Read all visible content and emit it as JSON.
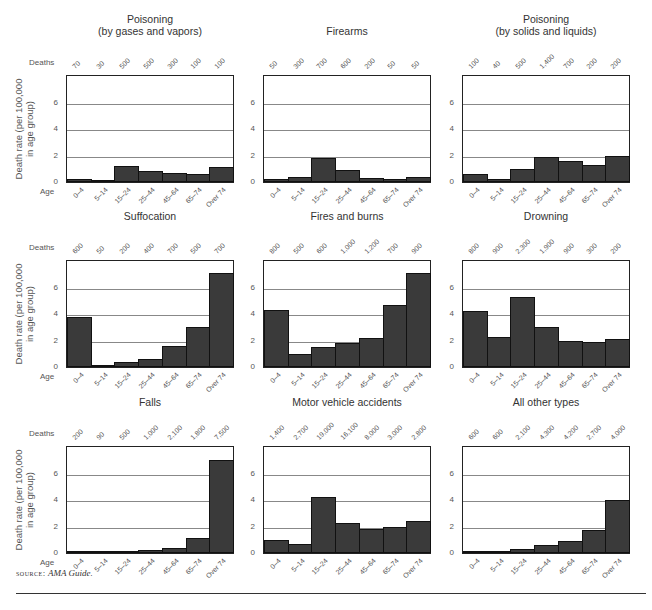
{
  "labels": {
    "deaths": "Deaths",
    "age": "Age",
    "ylabel": "Death rate (per 100,000\nin age group)",
    "source_prefix": "source:",
    "source_text": "AMA Guide."
  },
  "chart_data": [
    {
      "type": "bar",
      "title": "Poisoning\n(by gases and vapors)",
      "categories": [
        "0–4",
        "5–14",
        "15–24",
        "25–44",
        "45–64",
        "65–74",
        "Over 74"
      ],
      "deaths": [
        "70",
        "30",
        "500",
        "500",
        "300",
        "100",
        "100"
      ],
      "values": [
        0.2,
        0.1,
        1.2,
        0.8,
        0.7,
        0.6,
        1.1
      ],
      "ylabel": "Death rate (per 100,000 in age group)",
      "xlabel": "Age",
      "ylim": [
        0,
        8
      ],
      "yticks": [
        0,
        2,
        4,
        6
      ],
      "grid": true
    },
    {
      "type": "bar",
      "title": "Firearms",
      "categories": [
        "0–4",
        "5–14",
        "15–24",
        "25–44",
        "45–64",
        "65–74",
        "Over 74"
      ],
      "deaths": [
        "50",
        "300",
        "700",
        "600",
        "200",
        "50",
        "50"
      ],
      "values": [
        0.2,
        0.4,
        1.8,
        0.9,
        0.3,
        0.2,
        0.4
      ],
      "ylim": [
        0,
        8
      ],
      "yticks": [
        0,
        2,
        4,
        6
      ],
      "grid": true
    },
    {
      "type": "bar",
      "title": "Poisoning\n(by solids and liquids)",
      "categories": [
        "0–4",
        "5–14",
        "15–24",
        "25–44",
        "45–64",
        "65–74",
        "Over 74"
      ],
      "deaths": [
        "100",
        "40",
        "500",
        "1,400",
        "700",
        "200",
        "200"
      ],
      "values": [
        0.6,
        0.2,
        1.0,
        1.9,
        1.6,
        1.3,
        2.0
      ],
      "ylim": [
        0,
        8
      ],
      "yticks": [
        0,
        2,
        4,
        6
      ],
      "grid": true
    },
    {
      "type": "bar",
      "title": "Suffocation",
      "categories": [
        "0–4",
        "5–14",
        "15–24",
        "25–44",
        "45–64",
        "65–74",
        "Over 74"
      ],
      "deaths": [
        "600",
        "50",
        "200",
        "400",
        "700",
        "500",
        "700"
      ],
      "values": [
        3.8,
        0.1,
        0.4,
        0.6,
        1.6,
        3.0,
        7.1
      ],
      "ylabel": "Death rate (per 100,000 in age group)",
      "xlabel": "Age",
      "ylim": [
        0,
        8
      ],
      "yticks": [
        0,
        2,
        4,
        6
      ],
      "grid": true
    },
    {
      "type": "bar",
      "title": "Fires and burns",
      "categories": [
        "0–4",
        "5–14",
        "15–24",
        "25–44",
        "45–64",
        "65–74",
        "Over 74"
      ],
      "deaths": [
        "800",
        "500",
        "600",
        "1,000",
        "1,200",
        "700",
        "900"
      ],
      "values": [
        4.3,
        1.0,
        1.5,
        1.8,
        2.2,
        4.7,
        7.1
      ],
      "ylim": [
        0,
        8
      ],
      "yticks": [
        0,
        2,
        4,
        6
      ],
      "grid": true
    },
    {
      "type": "bar",
      "title": "Drowning",
      "categories": [
        "0–4",
        "5–14",
        "15–24",
        "25–44",
        "45–64",
        "65–74",
        "Over 74"
      ],
      "deaths": [
        "800",
        "900",
        "2,300",
        "1,900",
        "900",
        "300",
        "200"
      ],
      "values": [
        4.2,
        2.3,
        5.3,
        3.0,
        2.0,
        1.9,
        2.1
      ],
      "ylim": [
        0,
        8
      ],
      "yticks": [
        0,
        2,
        4,
        6
      ],
      "grid": true
    },
    {
      "type": "bar",
      "title": "Falls",
      "categories": [
        "0–4",
        "5–14",
        "15–24",
        "25–44",
        "45–64",
        "65–74",
        "Over 74"
      ],
      "deaths": [
        "200",
        "90",
        "500",
        "1,000",
        "2,100",
        "1,800",
        "7,500"
      ],
      "values": [
        0.1,
        0.05,
        0.15,
        0.25,
        0.4,
        1.1,
        7.0
      ],
      "ylabel": "Death rate (per 100,000 in age group)",
      "xlabel": "Age",
      "ylim": [
        0,
        8
      ],
      "yticks": [
        0,
        2,
        4,
        6
      ],
      "grid": true
    },
    {
      "type": "bar",
      "title": "Motor vehicle accidents",
      "categories": [
        "0–4",
        "5–14",
        "15–24",
        "25–44",
        "45–64",
        "65–74",
        "Over 74"
      ],
      "deaths": [
        "1,400",
        "2,700",
        "19,000",
        "16,100",
        "8,000",
        "3,000",
        "2,800"
      ],
      "values": [
        1.0,
        0.7,
        4.2,
        2.3,
        1.8,
        2.0,
        2.4
      ],
      "ylim": [
        0,
        8
      ],
      "yticks": [
        0,
        2,
        4,
        6
      ],
      "grid": true
    },
    {
      "type": "bar",
      "title": "All other types",
      "categories": [
        "0–4",
        "5–14",
        "15–24",
        "25–44",
        "45–64",
        "65–74",
        "Over 74"
      ],
      "deaths": [
        "600",
        "600",
        "2,100",
        "4,300",
        "4,200",
        "2,700",
        "4,000"
      ],
      "values": [
        0.15,
        0.1,
        0.3,
        0.6,
        0.9,
        1.7,
        4.0
      ],
      "ylim": [
        0,
        8
      ],
      "yticks": [
        0,
        2,
        4,
        6
      ],
      "grid": true
    }
  ],
  "colors": {
    "bar": "#3a3a3a",
    "grid": "#888888",
    "frame": "#222222"
  }
}
